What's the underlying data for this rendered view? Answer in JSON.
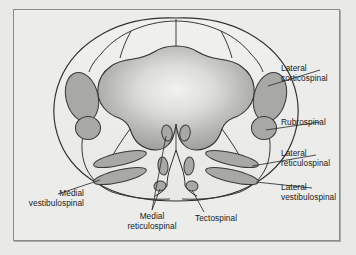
{
  "figure": {
    "frame": {
      "border_color": "#8a8a88",
      "background": "#ececeb"
    }
  },
  "colors": {
    "page_background": "#e9e9e7",
    "panel_background": "#ececeb",
    "tract_fill": "#a8a8a6",
    "tract_stroke": "#3a3a3a",
    "gray_matter_light": "#e3e3e1",
    "gray_matter_dark": "#9d9d9b",
    "outline": "#2e2e2e",
    "leader_line": "#2e2e2e",
    "text": "#1a1a1a"
  },
  "labels": [
    {
      "id": "lateral-corticospinal",
      "lines": [
        "Lateral",
        "corticospinal"
      ],
      "side": "right"
    },
    {
      "id": "rubrospinal",
      "lines": [
        "Rubrospinal"
      ],
      "side": "right"
    },
    {
      "id": "lateral-reticulospinal",
      "lines": [
        "Lateral",
        "reticulospinal"
      ],
      "side": "right"
    },
    {
      "id": "lateral-vestibulospinal",
      "lines": [
        "Lateral",
        "vestibulospinal"
      ],
      "side": "right"
    },
    {
      "id": "medial-vestibulospinal",
      "lines": [
        "Medial",
        "vestibulospinal"
      ],
      "side": "left"
    },
    {
      "id": "medial-reticulospinal",
      "lines": [
        "Medial",
        "reticulospinal"
      ],
      "side": "bottom"
    },
    {
      "id": "tectospinal",
      "lines": [
        "Tectospinal"
      ],
      "side": "bottom"
    }
  ],
  "label_text": {
    "lateral_corticospinal_l1": "Lateral",
    "lateral_corticospinal_l2": "corticospinal",
    "rubrospinal_l1": "Rubrospinal",
    "lateral_reticulospinal_l1": "Lateral",
    "lateral_reticulospinal_l2": "reticulospinal",
    "lateral_vestibulospinal_l1": "Lateral",
    "lateral_vestibulospinal_l2": "vestibulospinal",
    "medial_vestibulospinal_l1": "Medial",
    "medial_vestibulospinal_l2": "vestibulospinal",
    "medial_reticulospinal_l1": "Medial",
    "medial_reticulospinal_l2": "reticulospinal",
    "tectospinal_l1": "Tectospinal"
  },
  "tracts": [
    {
      "name": "lateral-corticospinal",
      "shape": "large-oval",
      "position": "dorsolateral",
      "paired": true
    },
    {
      "name": "rubrospinal",
      "shape": "small-circle",
      "position": "lateral",
      "paired": true
    },
    {
      "name": "lateral-reticulospinal",
      "shape": "elongated-band",
      "position": "ventrolateral-inner",
      "paired": true
    },
    {
      "name": "lateral-vestibulospinal",
      "shape": "elongated-band",
      "position": "ventrolateral-outer",
      "paired": true
    },
    {
      "name": "medial-vestibulospinal",
      "shape": "elongated-band",
      "position": "ventrolateral-outer-left",
      "paired": true
    },
    {
      "name": "medial-reticulospinal",
      "shape": "small-oval",
      "position": "ventromedial",
      "paired": true
    },
    {
      "name": "tectospinal",
      "shape": "small-oval",
      "position": "ventral-median",
      "paired": true
    }
  ]
}
